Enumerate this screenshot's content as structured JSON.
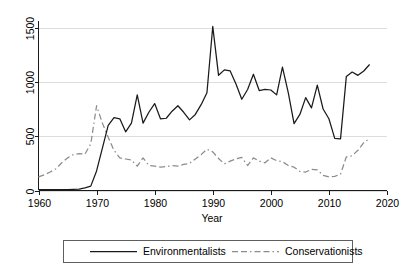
{
  "chart_data": {
    "type": "line",
    "title": "",
    "subtitle": "",
    "xlabel": "Year",
    "ylabel": "",
    "xlim": [
      1960,
      2020
    ],
    "ylim": [
      0,
      1560
    ],
    "grid": true,
    "grid_axis": "y",
    "legend_position": "bottom-outside",
    "x_ticks": [
      1960,
      1970,
      1980,
      1990,
      2000,
      2010,
      2020
    ],
    "x_tick_labels": [
      "1960",
      "1970",
      "1980",
      "1990",
      "2000",
      "2010",
      "2020"
    ],
    "y_ticks": [
      0,
      500,
      1000,
      1500
    ],
    "y_tick_labels": [
      "0",
      "500",
      "1000",
      "1500"
    ],
    "y_tick_label_rotation": 90,
    "x": [
      1960,
      1961,
      1962,
      1963,
      1964,
      1965,
      1966,
      1967,
      1968,
      1969,
      1970,
      1971,
      1972,
      1973,
      1974,
      1975,
      1976,
      1977,
      1978,
      1979,
      1980,
      1981,
      1982,
      1983,
      1984,
      1985,
      1986,
      1987,
      1988,
      1989,
      1990,
      1991,
      1992,
      1993,
      1994,
      1995,
      1996,
      1997,
      1998,
      1999,
      2000,
      2001,
      2002,
      2003,
      2004,
      2005,
      2006,
      2007,
      2008,
      2009,
      2010,
      2011,
      2012,
      2013,
      2014,
      2015,
      2016,
      2017
    ],
    "series": [
      {
        "name": "Environmentalists",
        "color": "#1a1a1a",
        "style": "solid",
        "values": [
          8,
          8,
          8,
          8,
          8,
          8,
          10,
          12,
          25,
          40,
          180,
          390,
          600,
          670,
          660,
          540,
          620,
          880,
          620,
          720,
          800,
          660,
          665,
          730,
          780,
          720,
          650,
          700,
          790,
          900,
          1510,
          1060,
          1110,
          1100,
          980,
          840,
          930,
          1070,
          920,
          930,
          925,
          880,
          1135,
          900,
          615,
          700,
          855,
          760,
          970,
          750,
          660,
          480,
          475,
          1050,
          1090,
          1060,
          1100,
          1160
        ]
      },
      {
        "name": "Conservationists",
        "color": "#8c8c8c",
        "style": "dashed",
        "values": [
          125,
          145,
          170,
          200,
          255,
          300,
          330,
          340,
          335,
          430,
          780,
          620,
          490,
          370,
          300,
          290,
          280,
          225,
          300,
          230,
          225,
          215,
          220,
          230,
          225,
          240,
          250,
          290,
          330,
          380,
          355,
          295,
          245,
          270,
          290,
          305,
          230,
          300,
          270,
          255,
          300,
          275,
          265,
          230,
          215,
          175,
          170,
          195,
          190,
          140,
          125,
          130,
          150,
          310,
          320,
          370,
          440,
          480
        ]
      }
    ]
  },
  "axis": {
    "x_title": "Year"
  },
  "legend": {
    "items": [
      {
        "label": "Environmentalists",
        "swatch": "solid-line-swatch"
      },
      {
        "label": "Conservationists",
        "swatch": "dashed-line-swatch"
      }
    ]
  }
}
